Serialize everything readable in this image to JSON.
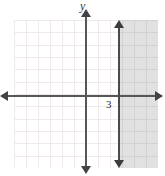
{
  "chart_data": {
    "type": "line",
    "title": "",
    "xlabel": "",
    "ylabel": "y",
    "axis_labels": {
      "y": "y"
    },
    "tick_labels": {
      "x": [
        "3"
      ],
      "y": []
    },
    "xlim": [
      -6,
      6
    ],
    "ylim": [
      -6,
      6
    ],
    "grid": true,
    "grid_spacing": 1,
    "legend": null,
    "series": [
      {
        "name": "boundary-line",
        "kind": "vertical-line",
        "equation": "x = 3",
        "x": 3,
        "style": "solid",
        "arrows": [
          "up",
          "down"
        ],
        "color": "#4a4a4a"
      }
    ],
    "shaded_region": {
      "name": "solution-region",
      "inequality": "x >= 3",
      "side": "right",
      "boundary_x": 3,
      "color": "#d8d8d8",
      "included_boundary": true
    },
    "annotations": [
      {
        "text": "3",
        "x": 3,
        "y": 0,
        "placement": "below-axis-left-of-line"
      }
    ]
  },
  "axes": {
    "x_axis_name": "x-axis",
    "y_axis_name": "y-axis",
    "y_label_text": "y",
    "x_tick_3": "3"
  },
  "colors": {
    "grid": "#f0e9ea",
    "axis": "#575757",
    "boundary": "#4a4a4a",
    "shading": "#d8d8d8",
    "background": "#ffffff"
  }
}
